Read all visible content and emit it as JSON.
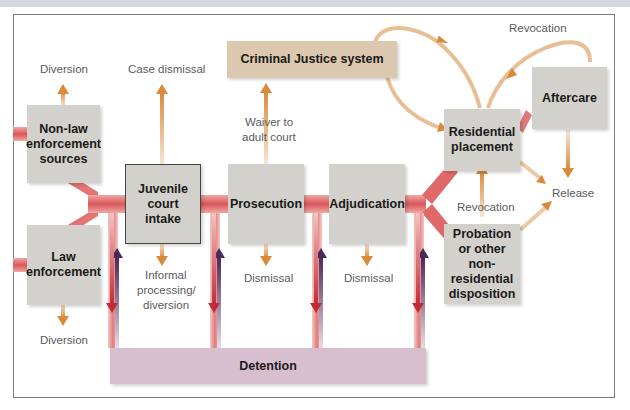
{
  "diagram": {
    "title": "",
    "colors": {
      "main_flow": "#d9565a",
      "main_flow_light": "#f2b3ae",
      "exit_arrow": "#d98a3a",
      "exit_arrow_light": "#f3dcc4",
      "detention_down": "#c42a35",
      "detention_up": "#4b2a5a",
      "node_fill": "#d3d1cb",
      "cjs_fill": "#dcc8ae",
      "detention_fill": "#d8bfcf",
      "header_bar": "#d3d9e3"
    },
    "nodes": {
      "non_law": "Non-law enforcement sources",
      "law": "Law enforcement",
      "intake": "Juvenile court intake",
      "prosecution": "Prosecution",
      "adjudication": "Adjudication",
      "cjs": "Criminal Justice system",
      "residential": "Residential placement",
      "aftercare": "Aftercare",
      "probation": "Probation or other non-residential disposition",
      "detention": "Detention"
    },
    "labels": {
      "diversion_top": "Diversion",
      "diversion_bottom": "Diversion",
      "case_dismissal": "Case dismissal",
      "waiver_1": "Waiver to",
      "waiver_2": "adult court",
      "informal_1": "Informal",
      "informal_2": "processing/",
      "informal_3": "diversion",
      "dismissal_prosecution": "Dismissal",
      "dismissal_adjudication": "Dismissal",
      "revocation_top": "Revocation",
      "revocation_mid": "Revocation",
      "release": "Release"
    }
  }
}
